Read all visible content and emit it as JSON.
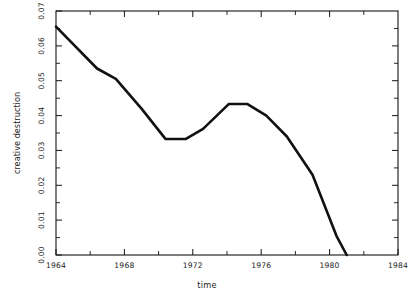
{
  "chart_data": {
    "type": "line",
    "title": "",
    "xlabel": "time",
    "ylabel": "creative destruction",
    "xlim": [
      1964,
      1984
    ],
    "ylim": [
      0.0,
      0.07
    ],
    "grid": false,
    "legend": null,
    "xticks": [
      "1964",
      "1968",
      "1972",
      "1976",
      "1980",
      "1984"
    ],
    "xtick_values": [
      1964,
      1968,
      1972,
      1976,
      1980,
      1984
    ],
    "yticks": [
      "0.00",
      "0.01",
      "0.02",
      "0.03",
      "0.04",
      "0.05",
      "0.06",
      "0.07"
    ],
    "ytick_values": [
      0.0,
      0.01,
      0.02,
      0.03,
      0.04,
      0.05,
      0.06,
      0.07
    ],
    "series": [
      {
        "name": "creative destruction",
        "color": "#111111",
        "x": [
          1964.0,
          1966.4,
          1967.5,
          1969.0,
          1970.4,
          1971.6,
          1972.6,
          1974.1,
          1975.2,
          1976.3,
          1977.5,
          1979.0,
          1980.4,
          1981.0
        ],
        "values": [
          0.0655,
          0.0535,
          0.0505,
          0.042,
          0.0333,
          0.0333,
          0.0362,
          0.0433,
          0.0433,
          0.04,
          0.034,
          0.023,
          0.0055,
          0.0
        ]
      }
    ]
  },
  "axes": {
    "x_label_text": "time",
    "y_label_text": "creative destruction"
  }
}
